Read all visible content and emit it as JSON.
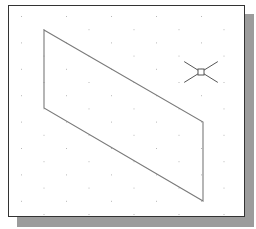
{
  "drawing_area": {
    "frame_color": "#333333",
    "shadow_color": "#9c9c9c",
    "background": "#ffffff",
    "grid": {
      "type": "isometric-dots",
      "dot_color": "#b8b8b8",
      "column_spacing": 45,
      "row_spacing": 13.2,
      "row_offset": 22.5,
      "origin": [
        21,
        16
      ],
      "bounds": {
        "x0": 11,
        "y0": 8,
        "x1": 242,
        "y1": 214
      }
    },
    "shape": {
      "type": "parallelogram",
      "stroke": "#7a7a7a",
      "points": [
        [
          44,
          30
        ],
        [
          203,
          122
        ],
        [
          203,
          201
        ],
        [
          44,
          108
        ]
      ]
    },
    "cursor": {
      "type": "crosshair-pickbox",
      "center": [
        201,
        72
      ],
      "arm_length": 24,
      "pickbox_size": 6,
      "color": "#555555"
    }
  }
}
